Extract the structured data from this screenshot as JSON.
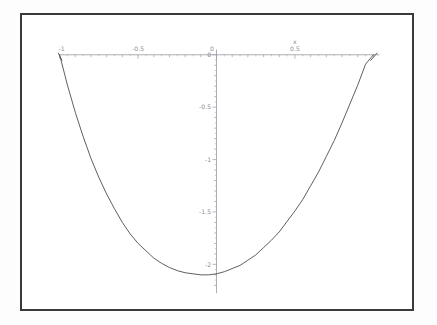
{
  "figure": {
    "background_color": "#ffffff",
    "frame_color": "#3a3a3c",
    "axis_color": "#9a9a9f",
    "curve_color": "#4a4a4d",
    "label_color": "#8d8d92"
  },
  "chart_data": {
    "type": "line",
    "title": "",
    "xlabel": "x",
    "ylabel": "",
    "xlim": [
      -1,
      1
    ],
    "ylim": [
      -2.2,
      0.05
    ],
    "grid": false,
    "legend": null,
    "x_tick_labels": [
      "-1",
      "-0.5",
      "0",
      "0.5"
    ],
    "x_tick_values": [
      -1,
      -0.5,
      0,
      0.5
    ],
    "y_tick_labels": [
      "0",
      "-0.5",
      "-1",
      "-1.5",
      "-2"
    ],
    "y_tick_values": [
      0,
      -0.5,
      -1,
      -1.5,
      -2
    ],
    "minor_ticks": true,
    "series": [
      {
        "name": "curve",
        "x": [
          -1.0,
          -0.95,
          -0.9,
          -0.85,
          -0.8,
          -0.75,
          -0.7,
          -0.65,
          -0.6,
          -0.55,
          -0.5,
          -0.45,
          -0.4,
          -0.35,
          -0.3,
          -0.25,
          -0.2,
          -0.15,
          -0.1,
          -0.05,
          0.0,
          0.05,
          0.1,
          0.15,
          0.2,
          0.25,
          0.3,
          0.35,
          0.4,
          0.45,
          0.5,
          0.55,
          0.6,
          0.65,
          0.7,
          0.75,
          0.8,
          0.85,
          0.9,
          0.95,
          1.0
        ],
        "y": [
          0.0,
          -0.29,
          -0.55,
          -0.78,
          -0.99,
          -1.17,
          -1.33,
          -1.47,
          -1.6,
          -1.71,
          -1.8,
          -1.87,
          -1.94,
          -1.99,
          -2.03,
          -2.06,
          -2.08,
          -2.09,
          -2.1,
          -2.1,
          -2.09,
          -2.07,
          -2.04,
          -2.01,
          -1.96,
          -1.91,
          -1.84,
          -1.77,
          -1.69,
          -1.59,
          -1.49,
          -1.38,
          -1.25,
          -1.12,
          -0.97,
          -0.82,
          -0.65,
          -0.47,
          -0.29,
          -0.09,
          0.0
        ]
      }
    ],
    "annotations": [
      {
        "text": "x",
        "x": 0.5,
        "y": 0.1,
        "role": "x-axis-name"
      }
    ]
  }
}
